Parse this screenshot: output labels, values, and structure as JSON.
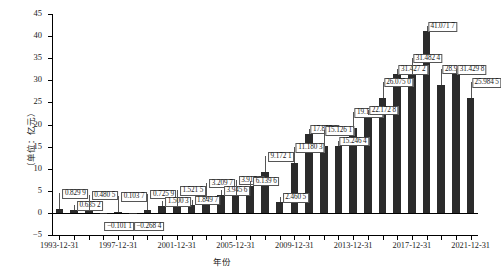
{
  "chart_data": {
    "type": "bar",
    "title": "",
    "xlabel": "年份",
    "ylabel": "（单位：亿元）",
    "ylim": [
      -5,
      45
    ],
    "ytick_step": 5,
    "grid": false,
    "legend": null,
    "yticks": [
      "45",
      "40",
      "35",
      "30",
      "25",
      "20",
      "15",
      "10",
      "5",
      "0",
      "-5"
    ],
    "xtick_labels": [
      "1993-12-31",
      "1997-12-31",
      "2001-12-31",
      "2005-12-31",
      "2009-12-31",
      "2013-12-31",
      "2017-12-31",
      "2021-12-31"
    ],
    "categories": [
      "1993-12-31",
      "1994-12-31",
      "1995-12-31",
      "1996-12-31",
      "1997-12-31",
      "1998-12-31",
      "1999-12-31",
      "2000-12-31",
      "2001-12-31",
      "2002-12-31",
      "2003-12-31",
      "2004-12-31",
      "2005-12-31",
      "2006-12-31",
      "2007-12-31",
      "2008-12-31",
      "2009-12-31",
      "2010-12-31",
      "2011-12-31",
      "2012-12-31",
      "2013-12-31",
      "2014-12-31",
      "2015-12-31",
      "2016-12-31",
      "2017-12-31",
      "2018-12-31",
      "2019-12-31",
      "2020-12-31",
      "2021-12-31"
    ],
    "values": [
      0.8299,
      0.6352,
      0.4805,
      -0.1011,
      0.1037,
      -0.2684,
      0.7259,
      1.5003,
      1.5215,
      1.8497,
      3.2097,
      3.9456,
      3.9172,
      6.1396,
      9.1721,
      2.4605,
      11.1803,
      17.8776,
      15.1261,
      15.2464,
      19.1712,
      22.1728,
      26.075,
      31.4272,
      31.4824,
      41.0717,
      28.9818,
      31.4298,
      25.9845
    ],
    "value_labels": [
      "0.829 9",
      "0.635 2",
      "0.480 5",
      "−0.101 1",
      "0.103 7",
      "−0.268 4",
      "0.725 9",
      "1.500 3",
      "1.521 5",
      "1.849 7",
      "3.209 7",
      "3.945 6",
      "3.917 2",
      "6.139 6",
      "9.172 1",
      "2.460 5",
      "11.180 3",
      "17.877 6",
      "15.126 1",
      "15.246 4",
      "19.171 2",
      "22.172 8",
      "26.075 0",
      "31.427 2",
      "31.482 4",
      "41.071 7",
      "28.981 8",
      "31.429 8",
      "25.984 5"
    ],
    "bar_color": "#2b2b2b"
  }
}
